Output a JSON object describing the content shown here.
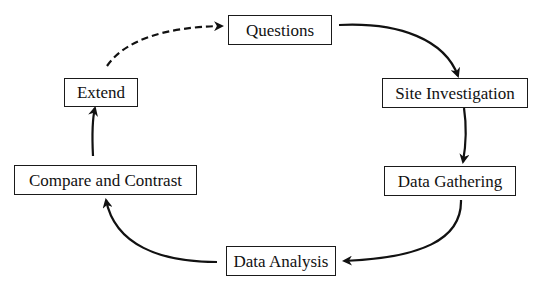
{
  "diagram": {
    "type": "cycle",
    "nodes": [
      {
        "id": "questions",
        "label": "Questions"
      },
      {
        "id": "site",
        "label": "Site Investigation"
      },
      {
        "id": "gathering",
        "label": "Data Gathering"
      },
      {
        "id": "analysis",
        "label": "Data Analysis"
      },
      {
        "id": "compare",
        "label": "Compare and Contrast"
      },
      {
        "id": "extend",
        "label": "Extend"
      }
    ],
    "edges": [
      {
        "from": "questions",
        "to": "site",
        "style": "solid"
      },
      {
        "from": "site",
        "to": "gathering",
        "style": "solid"
      },
      {
        "from": "gathering",
        "to": "analysis",
        "style": "solid"
      },
      {
        "from": "analysis",
        "to": "compare",
        "style": "solid"
      },
      {
        "from": "compare",
        "to": "extend",
        "style": "solid"
      },
      {
        "from": "extend",
        "to": "questions",
        "style": "dashed"
      }
    ]
  }
}
